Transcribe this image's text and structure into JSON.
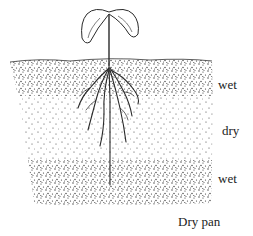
{
  "diagram": {
    "ink_color": "#2a2a2a",
    "background": "#ffffff",
    "layers": [
      {
        "name": "top-wet-layer",
        "label": "wet",
        "density": "dense",
        "y_top": 61,
        "y_bottom": 96
      },
      {
        "name": "dry-layer",
        "label": "dry",
        "density": "sparse",
        "y_top": 96,
        "y_bottom": 160
      },
      {
        "name": "lower-wet-layer",
        "label": "wet",
        "density": "dense",
        "y_top": 160,
        "y_bottom": 205
      }
    ],
    "labels": {
      "top_wet": "wet",
      "dry": "dry",
      "lower_wet": "wet",
      "dry_pan": "Dry pan"
    }
  }
}
